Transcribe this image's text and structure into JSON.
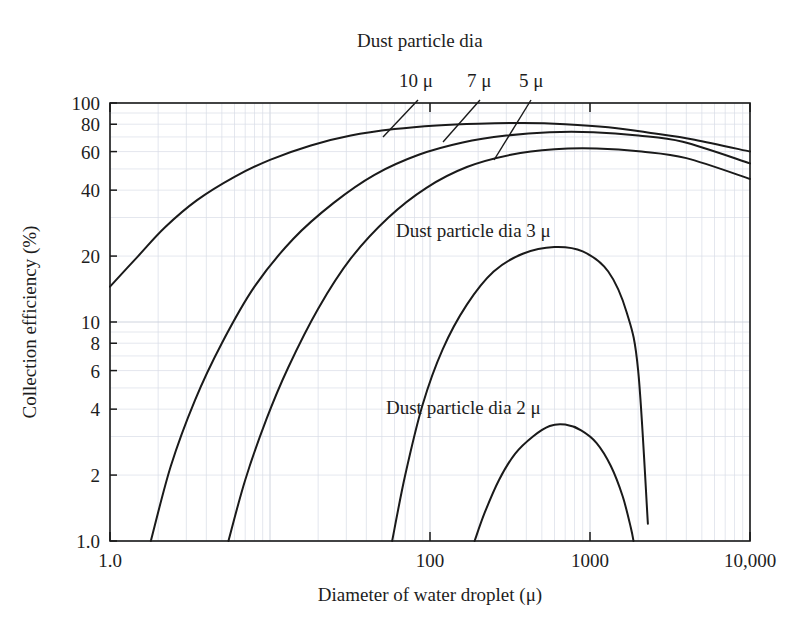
{
  "chart_data": {
    "type": "line",
    "title": "",
    "xlabel": "Diameter of water droplet (μ)",
    "ylabel": "Collection efficiency (%)",
    "xscale": "log",
    "yscale": "log",
    "xlim": [
      1.0,
      10000
    ],
    "ylim": [
      1.0,
      100
    ],
    "grid": true,
    "legend_position": "inline-annotations",
    "xticks": [
      {
        "value": 1.0,
        "label": "1.0"
      },
      {
        "value": 10,
        "label": ""
      },
      {
        "value": 100,
        "label": "100"
      },
      {
        "value": 1000,
        "label": "1000"
      },
      {
        "value": 10000,
        "label": "10,000"
      }
    ],
    "yticks": [
      {
        "value": 1.0,
        "label": "1.0"
      },
      {
        "value": 2,
        "label": "2"
      },
      {
        "value": 4,
        "label": "4"
      },
      {
        "value": 6,
        "label": "6"
      },
      {
        "value": 8,
        "label": "8"
      },
      {
        "value": 10,
        "label": "10"
      },
      {
        "value": 20,
        "label": "20"
      },
      {
        "value": 40,
        "label": "40"
      },
      {
        "value": 60,
        "label": "60"
      },
      {
        "value": 80,
        "label": "80"
      },
      {
        "value": 100,
        "label": "100"
      }
    ],
    "series": [
      {
        "name": "10 μ",
        "label": "10 μ",
        "x": [
          1.0,
          1.5,
          2.2,
          3.5,
          6,
          10,
          18,
          32,
          60,
          110,
          200,
          380,
          700,
          1300,
          2400,
          4500,
          10000
        ],
        "y": [
          14.5,
          20.0,
          27.0,
          36.0,
          46.0,
          55.0,
          64.0,
          71.0,
          76.0,
          79.0,
          80.5,
          81.0,
          80.0,
          77.5,
          73.0,
          68.0,
          60.0
        ]
      },
      {
        "name": "7 μ",
        "label": "7 μ",
        "x": [
          1.8,
          2.4,
          3.4,
          5.0,
          8.0,
          14,
          25,
          45,
          85,
          160,
          300,
          560,
          1050,
          2000,
          3800,
          10000
        ],
        "y": [
          1.0,
          2.2,
          4.4,
          8.0,
          14.5,
          24.0,
          35.0,
          47.0,
          58.0,
          66.0,
          71.0,
          73.5,
          73.5,
          71.0,
          66.5,
          53.0
        ]
      },
      {
        "name": "5 μ",
        "label": "5 μ",
        "x": [
          5.5,
          7.0,
          9.5,
          13,
          20,
          32,
          55,
          95,
          170,
          320,
          600,
          1100,
          2100,
          4000,
          10000
        ],
        "y": [
          1.0,
          1.9,
          3.6,
          6.2,
          11.5,
          19.5,
          30.0,
          41.0,
          51.0,
          58.0,
          61.5,
          62.0,
          60.0,
          56.0,
          45.0
        ]
      },
      {
        "name": "3 μ",
        "label": "Dust particle dia 3 μ",
        "x": [
          58,
          70,
          90,
          120,
          170,
          250,
          380,
          600,
          900,
          1300,
          1700,
          2000,
          2300
        ],
        "y": [
          1.0,
          2.0,
          4.2,
          7.5,
          12.0,
          17.0,
          20.5,
          22.0,
          21.0,
          17.0,
          11.0,
          6.0,
          1.2
        ]
      },
      {
        "name": "2 μ",
        "label": "Dust particle dia 2 μ",
        "x": [
          190,
          220,
          270,
          340,
          440,
          560,
          700,
          880,
          1100,
          1350,
          1600,
          1800,
          1870
        ],
        "y": [
          1.0,
          1.35,
          1.9,
          2.5,
          3.0,
          3.35,
          3.4,
          3.2,
          2.8,
          2.2,
          1.6,
          1.15,
          1.0
        ]
      }
    ],
    "annotations": [
      {
        "name": "dust-particle-dia-header",
        "text": "Dust particle dia",
        "x_px": 357,
        "y_px": 47
      },
      {
        "name": "label-10u",
        "text": "10 μ",
        "x_px": 399,
        "y_px": 87
      },
      {
        "name": "label-7u",
        "text": "7 μ",
        "x_px": 467,
        "y_px": 87
      },
      {
        "name": "label-5u",
        "text": "5 μ",
        "x_px": 519,
        "y_px": 87
      },
      {
        "name": "label-3u",
        "text": "Dust particle dia 3 μ",
        "x_px": 396,
        "y_px": 237
      },
      {
        "name": "label-2u",
        "text": "Dust particle dia 2 μ",
        "x_px": 386,
        "y_px": 414
      }
    ],
    "colors": {
      "curve": "#1a1a1a",
      "frame": "#1a1a1a",
      "grid_minor": "#d9dde6",
      "grid_major": "#c9cfda",
      "background": "#ffffff",
      "text": "#1d1d1d"
    }
  }
}
